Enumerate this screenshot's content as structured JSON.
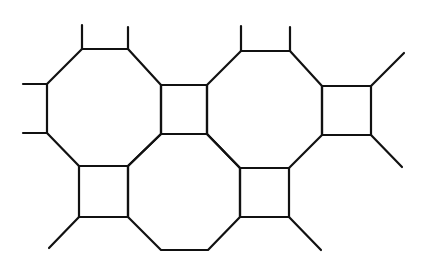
{
  "diagram": {
    "title": "",
    "stroke_color": "#111111",
    "background": "#ffffff",
    "stroke_width": 2.2,
    "polygons": [
      {
        "name": "octagon-top-left",
        "points": [
          [
            82,
            49
          ],
          [
            128,
            49
          ],
          [
            161,
            85
          ],
          [
            161,
            134
          ],
          [
            128,
            166
          ],
          [
            79,
            166
          ],
          [
            47,
            133
          ],
          [
            47,
            84
          ]
        ]
      },
      {
        "name": "octagon-top-right",
        "points": [
          [
            241,
            51
          ],
          [
            290,
            51
          ],
          [
            322,
            86
          ],
          [
            322,
            135
          ],
          [
            289,
            168
          ],
          [
            240,
            168
          ],
          [
            207,
            134
          ],
          [
            207,
            85
          ]
        ]
      },
      {
        "name": "octagon-bottom-middle",
        "points": [
          [
            161,
            134
          ],
          [
            207,
            134
          ],
          [
            240,
            168
          ],
          [
            240,
            217
          ],
          [
            208,
            250
          ],
          [
            161,
            250
          ],
          [
            128,
            217
          ],
          [
            128,
            166
          ]
        ]
      },
      {
        "name": "square-top-middle",
        "points": [
          [
            161,
            85
          ],
          [
            207,
            85
          ],
          [
            207,
            134
          ],
          [
            161,
            134
          ]
        ]
      },
      {
        "name": "square-top-right",
        "points": [
          [
            322,
            86
          ],
          [
            371,
            86
          ],
          [
            371,
            135
          ],
          [
            322,
            135
          ]
        ]
      },
      {
        "name": "square-bottom-left",
        "points": [
          [
            79,
            166
          ],
          [
            128,
            166
          ],
          [
            128,
            217
          ],
          [
            79,
            217
          ]
        ]
      },
      {
        "name": "square-bottom-right",
        "points": [
          [
            240,
            168
          ],
          [
            289,
            168
          ],
          [
            289,
            217
          ],
          [
            240,
            217
          ]
        ]
      }
    ],
    "stubs": [
      {
        "name": "stub-top-left-1",
        "from": [
          82,
          49
        ],
        "to": [
          82,
          25
        ]
      },
      {
        "name": "stub-top-left-2",
        "from": [
          128,
          49
        ],
        "to": [
          128,
          27
        ]
      },
      {
        "name": "stub-top-right-1",
        "from": [
          241,
          51
        ],
        "to": [
          241,
          26
        ]
      },
      {
        "name": "stub-top-right-2",
        "from": [
          290,
          51
        ],
        "to": [
          290,
          27
        ]
      },
      {
        "name": "stub-left-1",
        "from": [
          47,
          84
        ],
        "to": [
          23,
          84
        ]
      },
      {
        "name": "stub-left-2",
        "from": [
          47,
          133
        ],
        "to": [
          23,
          133
        ]
      },
      {
        "name": "stub-right-square-up",
        "from": [
          371,
          86
        ],
        "to": [
          404,
          53
        ]
      },
      {
        "name": "stub-right-square-down",
        "from": [
          371,
          135
        ],
        "to": [
          402,
          167
        ]
      },
      {
        "name": "stub-bottom-left",
        "from": [
          79,
          217
        ],
        "to": [
          49,
          248
        ]
      },
      {
        "name": "stub-bottom-right",
        "from": [
          289,
          217
        ],
        "to": [
          321,
          250
        ]
      }
    ]
  }
}
